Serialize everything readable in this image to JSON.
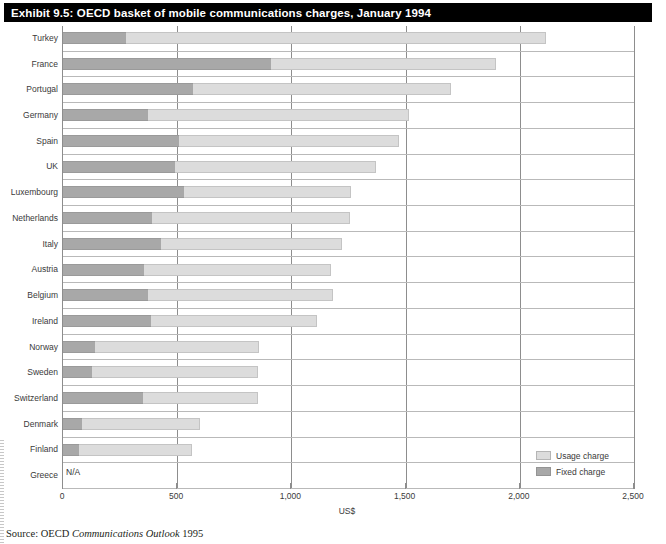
{
  "title": "Exhibit 9.5: OECD basket of mobile communications charges, January 1994",
  "source": {
    "prefix": "Source: OECD ",
    "publication": "Communications Outlook",
    "year": " 1995"
  },
  "legend": {
    "items": [
      {
        "label": "Usage charge",
        "key": "usage",
        "color": "#dcdcdc"
      },
      {
        "label": "Fixed charge",
        "key": "fixed",
        "color": "#a8a8a8"
      }
    ]
  },
  "chart_data": {
    "type": "bar",
    "orientation": "horizontal",
    "stacked": true,
    "title": "Exhibit 9.5: OECD basket of mobile communications charges, January 1994",
    "xlabel": "US$",
    "ylabel": "",
    "xlim": [
      0,
      2500
    ],
    "xticks": [
      0,
      500,
      1000,
      1500,
      2000,
      2500
    ],
    "xtick_labels": [
      "0",
      "500",
      "1,000",
      "1,500",
      "2,000",
      "2,500"
    ],
    "grid": true,
    "legend_position": "bottom-right",
    "categories": [
      "Turkey",
      "France",
      "Portugal",
      "Germany",
      "Spain",
      "UK",
      "Luxembourg",
      "Netherlands",
      "Italy",
      "Austria",
      "Belgium",
      "Ireland",
      "Norway",
      "Sweden",
      "Switzerland",
      "Denmark",
      "Finland",
      "Greece"
    ],
    "series": [
      {
        "name": "Fixed charge",
        "color": "#a8a8a8",
        "values": [
          276,
          910,
          570,
          372,
          510,
          490,
          530,
          390,
          430,
          355,
          370,
          385,
          140,
          125,
          350,
          85,
          70,
          null
        ]
      },
      {
        "name": "Usage charge",
        "color": "#dcdcdc",
        "values": [
          1839,
          985,
          1130,
          1143,
          960,
          880,
          730,
          865,
          790,
          820,
          810,
          725,
          720,
          730,
          505,
          515,
          495,
          null
        ]
      }
    ],
    "totals": [
      2115,
      1895,
      1700,
      1515,
      1470,
      1370,
      1260,
      1255,
      1220,
      1175,
      1180,
      1110,
      860,
      855,
      855,
      600,
      565,
      null
    ],
    "missing_label": "N/A",
    "missing_categories": [
      "Greece"
    ]
  }
}
